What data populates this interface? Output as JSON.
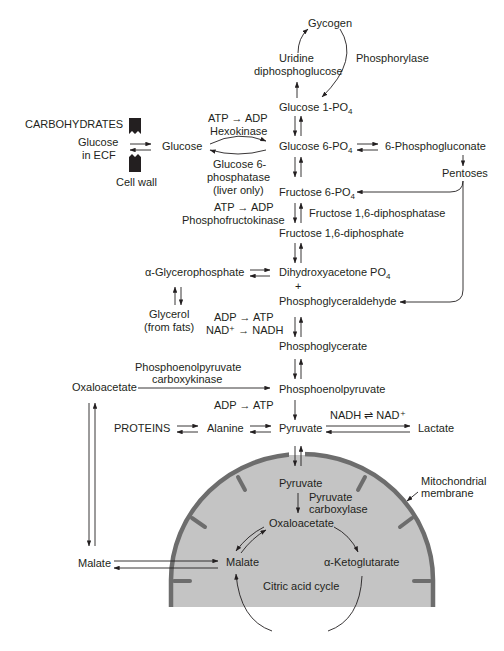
{
  "diagram": {
    "colors": {
      "text": "#231f20",
      "mito_fill": "#c4c4c4",
      "mito_membrane": "#6d6d6d",
      "background": "#ffffff"
    },
    "nodes": {
      "glycogen": "Gycogen",
      "udpg_1": "Uridine",
      "udpg_2": "diphosphoglucose",
      "phosphorylase": "Phosphorylase",
      "glucose_1_po4": "Glucose 1-PO",
      "glucose_1_po4_sub": "4",
      "carbohydrates": "CARBOHYDRATES",
      "glucose_ecf_1": "Glucose",
      "glucose_ecf_2": "in ECF",
      "cell_wall": "Cell wall",
      "glucose": "Glucose",
      "atp_adp_1": "ATP → ADP",
      "hexokinase": "Hexokinase",
      "g6pase_1": "Glucose 6-",
      "g6pase_2": "phosphatase",
      "g6pase_3": "(liver only)",
      "glucose_6_po4": "Glucose 6-PO",
      "glucose_6_po4_sub": "4",
      "phosphogluconate": "6-Phosphogluconate",
      "pentoses": "Pentoses",
      "fructose_6_po4": "Fructose 6-PO",
      "fructose_6_po4_sub": "4",
      "atp_adp_2": "ATP → ADP",
      "phosphofructokinase": "Phosphofructokinase",
      "fructose_diphosphatase": "Fructose 1,6-diphosphatase",
      "fructose_diphosphate": "Fructose 1,6-diphosphate",
      "glycerophosphate": "α-Glycerophosphate",
      "dhap": "Dihydroxyacetone PO",
      "dhap_sub": "4",
      "plus": "+",
      "phosphoglyceraldehyde": "Phosphoglyceraldehyde",
      "glycerol_1": "Glycerol",
      "glycerol_2": "(from fats)",
      "adp_atp_1": "ADP → ATP",
      "nad_nadh": "NAD⁺ → NADH",
      "phosphoglycerate": "Phosphoglycerate",
      "pepck_1": "Phosphoenolpyruvate",
      "pepck_2": "carboxykinase",
      "oxaloacetate_cyto": "Oxaloacetate",
      "pep": "Phosphoenolpyruvate",
      "adp_atp_2": "ADP → ATP",
      "proteins": "PROTEINS",
      "alanine": "Alanine",
      "pyruvate_cyto": "Pyruvate",
      "nadh_nad": "NADH ⇌ NAD⁺",
      "lactate": "Lactate",
      "mito_membrane_1": "Mitochondrial",
      "mito_membrane_2": "membrane",
      "pyruvate_mito": "Pyruvate",
      "pyruvate_carboxylase_1": "Pyruvate",
      "pyruvate_carboxylase_2": "carboxylase",
      "oxaloacetate_mito": "Oxaloacetate",
      "malate_cyto": "Malate",
      "malate_mito": "Malate",
      "ketoglutarate": "α-Ketoglutarate",
      "citric_acid_cycle": "Citric acid cycle"
    }
  }
}
